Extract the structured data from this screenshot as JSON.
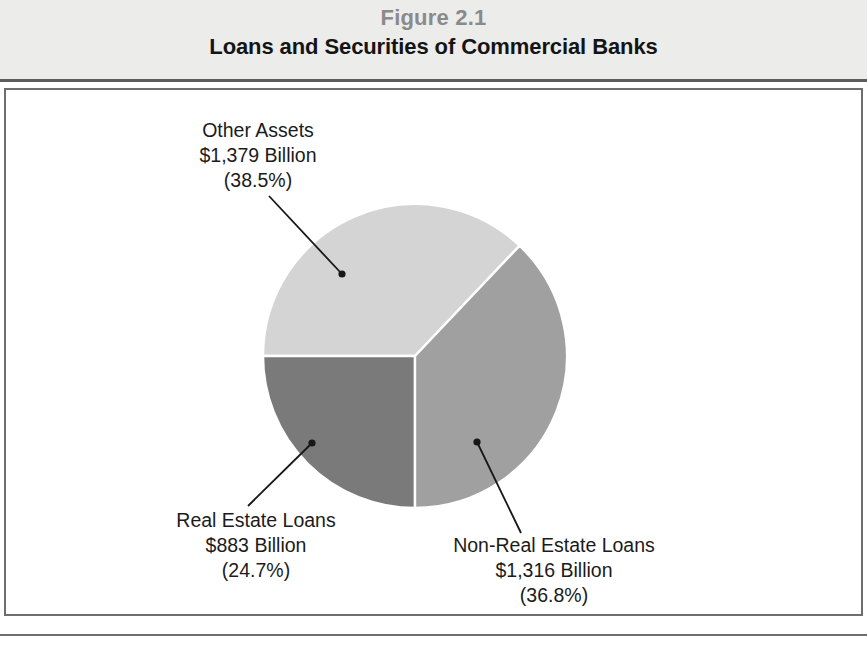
{
  "figure": {
    "number": "Figure 2.1",
    "title": "Loans and Securities of Commercial Banks"
  },
  "chart_data": {
    "type": "pie",
    "title": "Loans and Securities of Commercial Banks",
    "subtitle": "Figure 2.1",
    "xlabel": "",
    "ylabel": "",
    "units": "Billions of dollars",
    "legend_position": "callout-labels",
    "grid": false,
    "total_value": 3578,
    "total_percent": 100.0,
    "categories": [
      "Other Assets",
      "Real Estate Loans",
      "Non-Real Estate Loans"
    ],
    "values": [
      1379,
      883,
      1316
    ],
    "percentages": [
      38.5,
      24.7,
      36.8
    ],
    "colors": [
      "#d4d4d4",
      "#7a7a7a",
      "#a0a0a0"
    ],
    "slices": [
      {
        "name": "Other Assets",
        "label": "Other Assets",
        "value": 1379,
        "value_text": "$1,379 Billion",
        "percent": 38.5,
        "percent_text": "(38.5%)",
        "color": "#d4d4d4",
        "start_angle_deg": 46.5,
        "end_angle_deg": 180.0
      },
      {
        "name": "Real Estate Loans",
        "label": "Real Estate Loans",
        "value": 883,
        "value_text": "$883 Billion",
        "percent": 24.7,
        "percent_text": "(24.7%)",
        "color": "#7a7a7a",
        "start_angle_deg": 180.0,
        "end_angle_deg": 270.0
      },
      {
        "name": "Non-Real Estate Loans",
        "label": "Non-Real Estate Loans",
        "value": 1316,
        "value_text": "$1,316 Billion",
        "percent": 36.8,
        "percent_text": "(36.8%)",
        "color": "#a0a0a0",
        "start_angle_deg": 270.0,
        "end_angle_deg": 406.5
      }
    ]
  },
  "labels": {
    "other_assets": {
      "name": "Other Assets",
      "value": "$1,379 Billion",
      "percent": "(38.5%)"
    },
    "real_estate": {
      "name": "Real Estate Loans",
      "value": "$883 Billion",
      "percent": "(24.7%)"
    },
    "non_real_estate": {
      "name": "Non-Real Estate Loans",
      "value": "$1,316 Billion",
      "percent": "(36.8%)"
    }
  },
  "colors": {
    "slice_other_assets": "#d4d4d4",
    "slice_real_estate": "#7a7a7a",
    "slice_non_real_estate": "#a0a0a0",
    "banner_background": "#ececeb",
    "frame_border": "#6e6e6e",
    "figure_number_text": "#8a8a8a",
    "title_text": "#141414"
  }
}
